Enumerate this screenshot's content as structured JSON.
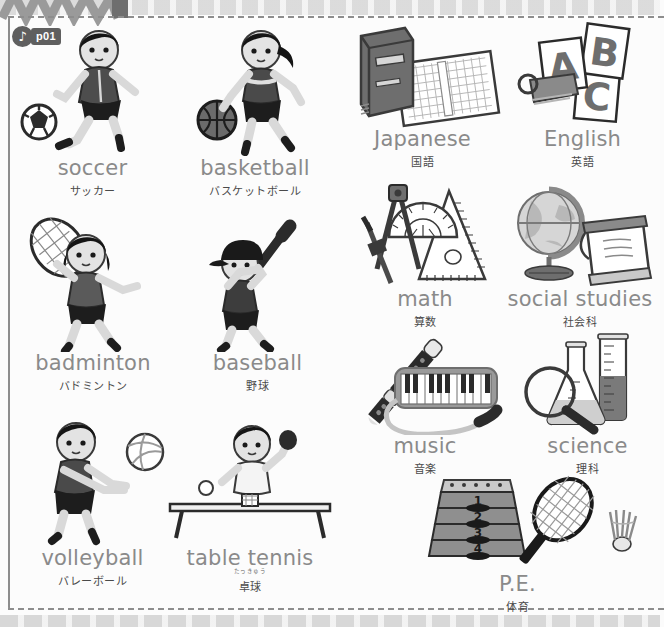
{
  "page": {
    "audio_badge": {
      "icon": "music-note-icon",
      "track_id": "p01"
    },
    "border_color": "#8d8d8d",
    "label_en_color": "#8a8a8a",
    "label_ja_color": "#4a4a4a"
  },
  "sports": [
    {
      "en": "soccer",
      "ja": "サッカー",
      "furigana": "",
      "icon": "soccer-player-illustration"
    },
    {
      "en": "basketball",
      "ja": "バスケットボール",
      "furigana": "",
      "icon": "basketball-player-illustration"
    },
    {
      "en": "badminton",
      "ja": "バドミントン",
      "furigana": "",
      "icon": "badminton-player-illustration"
    },
    {
      "en": "baseball",
      "ja": "野球",
      "furigana": "",
      "icon": "baseball-player-illustration"
    },
    {
      "en": "volleyball",
      "ja": "バレーボール",
      "furigana": "",
      "icon": "volleyball-player-illustration"
    },
    {
      "en": "table tennis",
      "ja": "卓球",
      "furigana": "たっきゅう",
      "icon": "table-tennis-player-illustration"
    }
  ],
  "subjects": [
    {
      "en": "Japanese",
      "ja": "国語",
      "icon": "book-and-manuscript-paper-illustration"
    },
    {
      "en": "English",
      "ja": "英語",
      "icon": "abc-flashcards-illustration"
    },
    {
      "en": "math",
      "ja": "算数",
      "icon": "compass-protractor-ruler-illustration"
    },
    {
      "en": "social studies",
      "ja": "社会科",
      "icon": "globe-and-scroll-map-illustration"
    },
    {
      "en": "music",
      "ja": "音楽",
      "icon": "recorder-and-melodica-illustration"
    },
    {
      "en": "science",
      "ja": "理科",
      "icon": "flask-cylinder-magnifier-illustration"
    },
    {
      "en": "P.E.",
      "ja": "体育",
      "icon": "vaulting-box-racket-shuttlecock-illustration"
    }
  ],
  "flashcard_letters": [
    "A",
    "B",
    "C"
  ],
  "vaulting_box_numbers": [
    "1",
    "2",
    "3",
    "4"
  ]
}
